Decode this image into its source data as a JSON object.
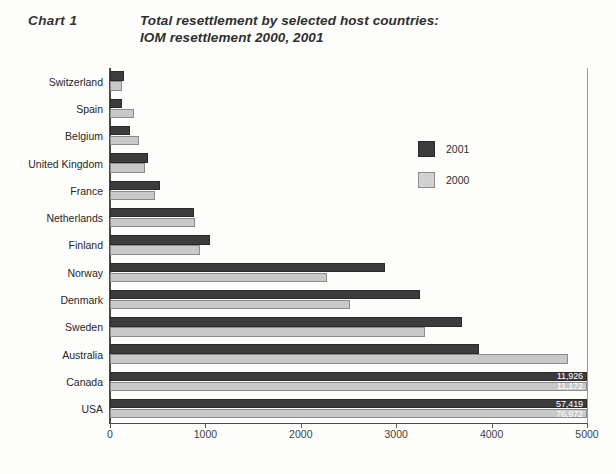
{
  "figure": {
    "chart_number_label": "Chart 1",
    "title_line1": "Total resettlement by selected host countries:",
    "title_line2": "IOM resettlement 2000, 2001"
  },
  "legend": {
    "items": [
      {
        "label": "2001",
        "color": "#3c3c3c",
        "swatch": "dark"
      },
      {
        "label": "2000",
        "color": "#c9c9c9",
        "swatch": "light"
      }
    ]
  },
  "axis": {
    "x_ticks": [
      "0",
      "1000",
      "2000",
      "3000",
      "4000",
      "5000"
    ],
    "x_min": 0,
    "x_max": 5000
  },
  "chart_data": {
    "type": "bar",
    "orientation": "horizontal",
    "title": "Total resettlement by selected host countries: IOM resettlement 2000, 2001",
    "xlabel": "",
    "ylabel": "",
    "xlim": [
      0,
      5000
    ],
    "grid": false,
    "legend_position": "upper-right-inside",
    "categories": [
      "Switzerland",
      "Spain",
      "Belgium",
      "United Kingdom",
      "France",
      "Netherlands",
      "Finland",
      "Norway",
      "Denmark",
      "Sweden",
      "Australia",
      "Canada",
      "USA"
    ],
    "series": [
      {
        "name": "2001",
        "color": "#3c3c3c",
        "values": [
          150,
          130,
          205,
          400,
          520,
          880,
          1050,
          2880,
          3250,
          3690,
          3870,
          11926,
          57419
        ],
        "clipped_at": 5000,
        "value_labels": [
          null,
          null,
          null,
          null,
          null,
          null,
          null,
          null,
          null,
          null,
          null,
          "11,926",
          "57,419"
        ]
      },
      {
        "name": "2000",
        "color": "#c9c9c9",
        "values": [
          125,
          250,
          300,
          370,
          470,
          890,
          940,
          2270,
          2520,
          3300,
          4800,
          11172,
          76972
        ],
        "clipped_at": 5000,
        "value_labels": [
          null,
          null,
          null,
          null,
          null,
          null,
          null,
          null,
          null,
          null,
          null,
          "11,172",
          "76,972"
        ]
      }
    ]
  }
}
